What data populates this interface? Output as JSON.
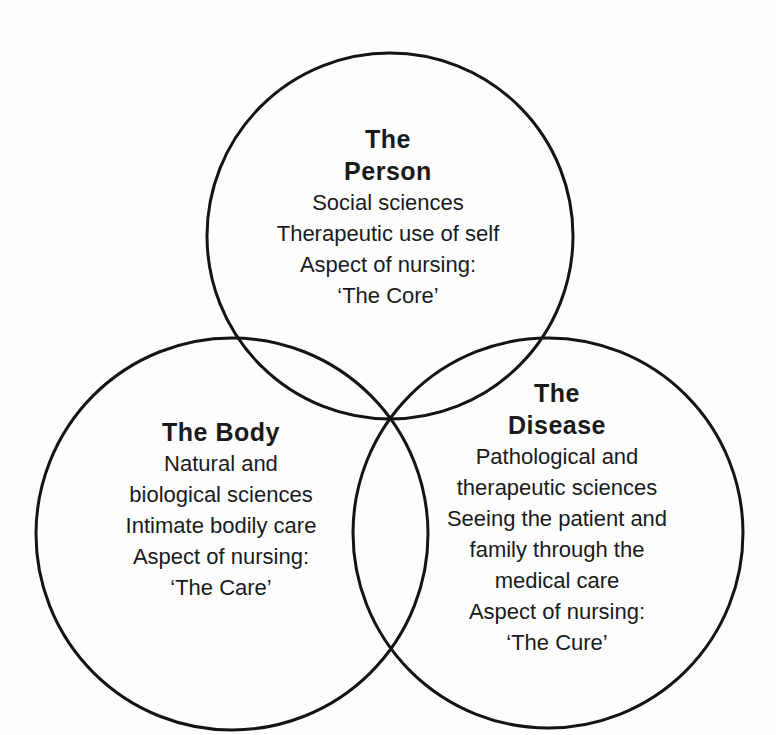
{
  "diagram": {
    "type": "venn-three-circle",
    "colors": {
      "background": "#fdfdfd",
      "circle_stroke": "#141414",
      "text": "#1a1a1a"
    },
    "circles": {
      "person": {
        "title_lines": [
          "The",
          "Person"
        ],
        "body_lines": [
          "Social sciences",
          "Therapeutic use of self",
          "Aspect of nursing:",
          "‘The Core’"
        ]
      },
      "body": {
        "title_lines": [
          "The Body"
        ],
        "body_lines": [
          "Natural and",
          "biological sciences",
          "Intimate bodily care",
          "Aspect of nursing:",
          "‘The Care’"
        ]
      },
      "disease": {
        "title_lines": [
          "The",
          "Disease"
        ],
        "body_lines": [
          "Pathological and",
          "therapeutic sciences",
          "Seeing the patient and",
          "family through the",
          "medical care",
          "Aspect of nursing:",
          "‘The Cure’"
        ]
      }
    }
  }
}
